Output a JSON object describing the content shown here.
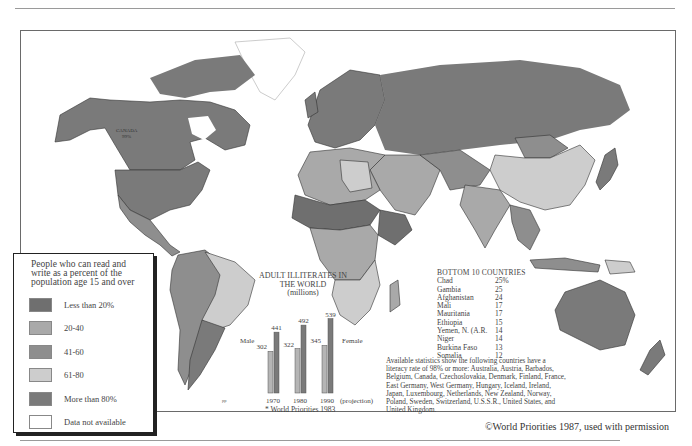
{
  "page": {
    "credit": "©World Priorities 1987, used with permission"
  },
  "map": {
    "title_hint": "Literacy rates worldwide",
    "country_label": {
      "name": "CANADA",
      "value": "99%"
    },
    "corner_mark": "pp"
  },
  "legend": {
    "title": "People who can read and write as a percent of the population age 15 and over",
    "items": [
      {
        "label": "Less than 20%",
        "color": "#6f6f6f"
      },
      {
        "label": "20-40",
        "color": "#a9a9a9"
      },
      {
        "label": "41-60",
        "color": "#8e8e8e"
      },
      {
        "label": "61-80",
        "color": "#cdcdcd"
      },
      {
        "label": "More than 80%",
        "color": "#7a7a7a"
      },
      {
        "label": "Data not available",
        "color": "#ffffff"
      }
    ]
  },
  "chart_data": {
    "type": "bar",
    "title": "ADULT ILLITERATES IN THE WORLD",
    "subtitle": "(millions)",
    "categories": [
      "1970",
      "1980",
      "1990"
    ],
    "category_note": "(projection)",
    "series": [
      {
        "name": "Male",
        "values": [
          302,
          322,
          345
        ],
        "color": "#b5b5b5"
      },
      {
        "name": "Female",
        "values": [
          441,
          492,
          539
        ],
        "color": "#7a7a7a"
      }
    ],
    "ylim": [
      0,
      600
    ],
    "source": "* World Priorities 1983"
  },
  "bottom10": {
    "title": "BOTTOM 10 COUNTRIES",
    "rows": [
      {
        "country": "Chad",
        "value": "25%"
      },
      {
        "country": "Gambia",
        "value": "25"
      },
      {
        "country": "Afghanistan",
        "value": "24"
      },
      {
        "country": "Mali",
        "value": "17"
      },
      {
        "country": "Mauritania",
        "value": "17"
      },
      {
        "country": "Ethiopia",
        "value": "15"
      },
      {
        "country": "Yemen, N. (A.R.",
        "value": "14"
      },
      {
        "country": "Niger",
        "value": "14"
      },
      {
        "country": "Burkina Faso",
        "value": "13"
      },
      {
        "country": "Somalia",
        "value": "12"
      }
    ]
  },
  "note": "Available statistics show the following countries have a literacy rate of 98% or more: Australia, Austria, Barbados, Belgium, Canada, Czechoslovakia, Denmark, Finland, France, East Germany, West Germany, Hungary, Iceland, Ireland, Japan, Luxembourg, Netherlands, New Zealand, Norway, Poland, Sweden, Switzerland, U.S.S.R., United States, and United Kingdom."
}
